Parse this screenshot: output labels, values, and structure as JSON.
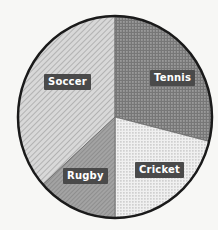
{
  "chart_data": {
    "type": "pie",
    "title": "",
    "subtitle": "",
    "xlabel": "",
    "ylabel": "",
    "grid": false,
    "legend_position": "none",
    "labels_inside": true,
    "categories": [
      "Soccer",
      "Tennis",
      "Cricket",
      "Rugby"
    ],
    "values": [
      37,
      29,
      21,
      13
    ],
    "units": "percent",
    "start_angle_deg": 0,
    "direction": "clockwise",
    "slice_boundaries_deg": [
      0,
      104,
      180,
      228,
      360
    ],
    "slices": [
      {
        "label": "Soccer",
        "value": 37,
        "start_deg": 228,
        "end_deg": 360,
        "fill": "#c9c9c9",
        "pattern": "diagonal-hatch-light",
        "label_x": 44,
        "label_y": 74
      },
      {
        "label": "Tennis",
        "value": 29,
        "start_deg": 0,
        "end_deg": 104,
        "fill": "#8a8a8a",
        "pattern": "dot-grid-dark",
        "label_x": 150,
        "label_y": 70
      },
      {
        "label": "Cricket",
        "value": 21,
        "start_deg": 104,
        "end_deg": 180,
        "fill": "#ececec",
        "pattern": "dot-grid-light",
        "label_x": 135,
        "label_y": 162
      },
      {
        "label": "Rugby",
        "value": 13,
        "start_deg": 180,
        "end_deg": 228,
        "fill": "#9e9e9e",
        "pattern": "diagonal-hatch-dark",
        "label_x": 63,
        "label_y": 168
      }
    ],
    "geometry": {
      "center_x": 115,
      "center_y": 117,
      "radius_x": 97,
      "radius_y": 101
    },
    "style": {
      "background": "#f7f7f5",
      "outline_color": "#1a1a1a",
      "outline_width": 2.5,
      "label_background": "#4a4a4a",
      "label_text_color": "#ffffff"
    }
  }
}
